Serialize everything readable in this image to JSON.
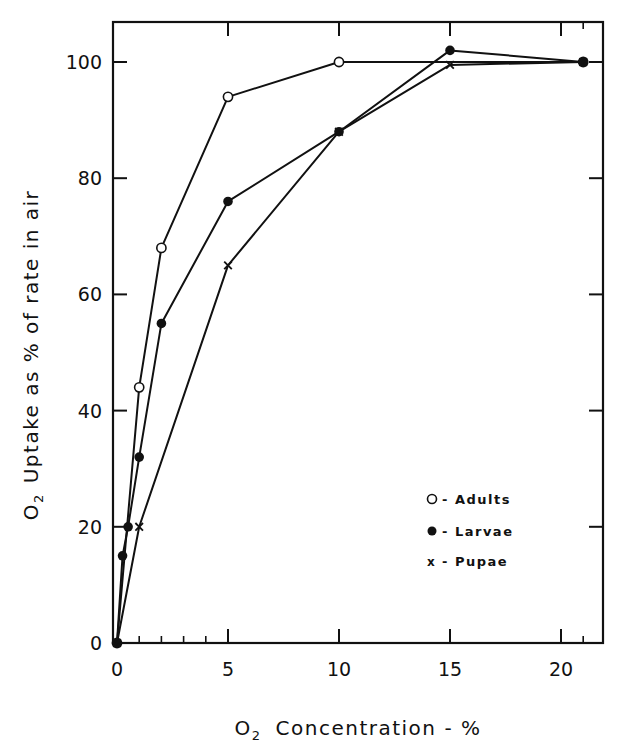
{
  "chart_data": {
    "type": "line",
    "title": "",
    "xlabel": "O2 Concentration - %",
    "xlabel_main": "Concentration - %",
    "ylabel": "O2 Uptake as % of rate in air",
    "ylabel_main": "Uptake as % of rate in air",
    "xlim": [
      0,
      22
    ],
    "ylim": [
      0,
      106
    ],
    "x_ticks": [
      0,
      5,
      10,
      15,
      20
    ],
    "x_tick_labels": [
      "0",
      "5",
      "10",
      "15",
      "20"
    ],
    "x_minor_ticks": [
      1,
      2,
      3,
      4,
      21
    ],
    "y_ticks": [
      0,
      20,
      40,
      60,
      80,
      100
    ],
    "y_tick_labels": [
      "0",
      "20",
      "40",
      "60",
      "80",
      "100"
    ],
    "grid": false,
    "legend_position": "lower right",
    "series": [
      {
        "name": "Adults",
        "legend_label": "- Adults",
        "marker": "open-circle",
        "x": [
          0,
          1,
          2,
          5,
          10,
          21
        ],
        "y": [
          0,
          44,
          68,
          94,
          100,
          100
        ]
      },
      {
        "name": "Larvae",
        "legend_label": "- Larvae",
        "marker": "filled-circle",
        "x": [
          0,
          0.25,
          0.5,
          1,
          2,
          5,
          10,
          15,
          21
        ],
        "y": [
          0,
          15,
          20,
          32,
          55,
          76,
          88,
          102,
          100
        ]
      },
      {
        "name": "Pupae",
        "legend_label": "- Pupae",
        "marker": "x-cross",
        "x": [
          0,
          1,
          5,
          10,
          15,
          21
        ],
        "y": [
          0,
          20,
          65,
          88,
          99.5,
          100
        ]
      }
    ]
  },
  "colors": {
    "ink": "#111111",
    "background": "#ffffff"
  }
}
